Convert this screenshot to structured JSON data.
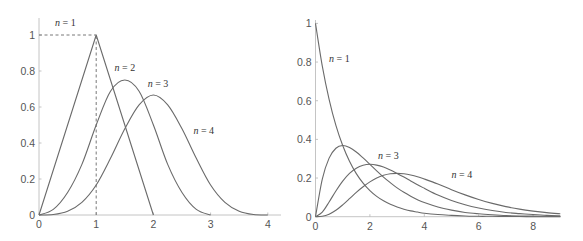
{
  "chart_data": [
    {
      "type": "line",
      "title": "",
      "xlabel": "",
      "ylabel": "",
      "xlim": [
        0,
        4.2
      ],
      "ylim": [
        0,
        1.1
      ],
      "grid": false,
      "x_ticks": [
        "0",
        "1",
        "2",
        "3",
        "4"
      ],
      "y_ticks": [
        "0",
        "0.2",
        "0.4",
        "0.6",
        "0.8",
        "1"
      ],
      "annotations": [
        {
          "type": "dashed-line",
          "from": [
            0,
            1
          ],
          "to": [
            1,
            1
          ]
        },
        {
          "type": "dashed-line",
          "from": [
            1,
            0
          ],
          "to": [
            1,
            1
          ]
        }
      ],
      "series": [
        {
          "name": "n = 1",
          "label_var": "n",
          "label_val": "1",
          "label_pos": [
            0.28,
            1.05
          ],
          "points": []
        },
        {
          "name": "n = 2",
          "label_var": "n",
          "label_val": "2",
          "label_pos": [
            1.32,
            0.8
          ],
          "points": [
            [
              0,
              0
            ],
            [
              1,
              1
            ],
            [
              2,
              0
            ]
          ]
        },
        {
          "name": "n = 3",
          "label_var": "n",
          "label_val": "3",
          "label_pos": [
            1.9,
            0.71
          ],
          "points": [
            [
              0,
              0
            ],
            [
              0.25,
              0.03125
            ],
            [
              0.5,
              0.125
            ],
            [
              0.75,
              0.28125
            ],
            [
              1,
              0.5
            ],
            [
              1.25,
              0.6875
            ],
            [
              1.5,
              0.75
            ],
            [
              1.75,
              0.6875
            ],
            [
              2,
              0.5
            ],
            [
              2.25,
              0.28125
            ],
            [
              2.5,
              0.125
            ],
            [
              2.75,
              0.03125
            ],
            [
              3,
              0
            ]
          ]
        },
        {
          "name": "n = 4",
          "label_var": "n",
          "label_val": "4",
          "label_pos": [
            2.7,
            0.45
          ],
          "points": [
            [
              0,
              0
            ],
            [
              0.25,
              0.0026
            ],
            [
              0.5,
              0.0208
            ],
            [
              0.75,
              0.0703
            ],
            [
              1,
              0.1667
            ],
            [
              1.25,
              0.3151
            ],
            [
              1.5,
              0.4792
            ],
            [
              1.75,
              0.612
            ],
            [
              2,
              0.6667
            ],
            [
              2.25,
              0.612
            ],
            [
              2.5,
              0.4792
            ],
            [
              2.75,
              0.3151
            ],
            [
              3,
              0.1667
            ],
            [
              3.25,
              0.0703
            ],
            [
              3.5,
              0.0208
            ],
            [
              3.75,
              0.0026
            ],
            [
              4,
              0
            ]
          ]
        }
      ]
    },
    {
      "type": "line",
      "title": "",
      "xlabel": "",
      "ylabel": "",
      "xlim": [
        0,
        9
      ],
      "ylim": [
        0,
        1
      ],
      "grid": false,
      "x_ticks": [
        "0",
        "2",
        "4",
        "6",
        "8"
      ],
      "y_ticks": [
        "0",
        "0.2",
        "0.4",
        "0.6",
        "0.8",
        "1"
      ],
      "series": [
        {
          "name": "n = 1",
          "label_var": "n",
          "label_val": "1",
          "label_pos": [
            0.5,
            0.8
          ],
          "points": [
            [
              0,
              1
            ],
            [
              0.25,
              0.779
            ],
            [
              0.5,
              0.607
            ],
            [
              0.75,
              0.472
            ],
            [
              1,
              0.368
            ],
            [
              1.25,
              0.287
            ],
            [
              1.5,
              0.223
            ],
            [
              1.75,
              0.174
            ],
            [
              2,
              0.135
            ],
            [
              2.25,
              0.105
            ],
            [
              2.5,
              0.082
            ],
            [
              2.75,
              0.064
            ],
            [
              3,
              0.05
            ],
            [
              3.25,
              0.039
            ],
            [
              3.5,
              0.03
            ],
            [
              3.75,
              0.024
            ],
            [
              4,
              0.018
            ],
            [
              4.5,
              0.011
            ],
            [
              5,
              0.007
            ],
            [
              5.5,
              0.004
            ],
            [
              6,
              0.002
            ],
            [
              6.5,
              0.002
            ],
            [
              7,
              0.001
            ],
            [
              7.5,
              0.001
            ],
            [
              8,
              0
            ],
            [
              8.5,
              0
            ],
            [
              9,
              0
            ]
          ]
        },
        {
          "name": "n = 2",
          "points": [
            [
              0,
              0
            ],
            [
              0.25,
              0.195
            ],
            [
              0.5,
              0.303
            ],
            [
              0.75,
              0.354
            ],
            [
              1,
              0.368
            ],
            [
              1.25,
              0.358
            ],
            [
              1.5,
              0.335
            ],
            [
              1.75,
              0.304
            ],
            [
              2,
              0.271
            ],
            [
              2.25,
              0.237
            ],
            [
              2.5,
              0.205
            ],
            [
              2.75,
              0.176
            ],
            [
              3,
              0.149
            ],
            [
              3.25,
              0.126
            ],
            [
              3.5,
              0.106
            ],
            [
              3.75,
              0.088
            ],
            [
              4,
              0.073
            ],
            [
              4.5,
              0.05
            ],
            [
              5,
              0.034
            ],
            [
              5.5,
              0.022
            ],
            [
              6,
              0.015
            ],
            [
              6.5,
              0.01
            ],
            [
              7,
              0.006
            ],
            [
              7.5,
              0.004
            ],
            [
              8,
              0.003
            ],
            [
              8.5,
              0.002
            ],
            [
              9,
              0.001
            ]
          ]
        },
        {
          "name": "n = 3",
          "label_var": "n",
          "label_val": "3",
          "label_pos": [
            2.3,
            0.3
          ],
          "points": [
            [
              0,
              0
            ],
            [
              0.25,
              0.024
            ],
            [
              0.5,
              0.076
            ],
            [
              0.75,
              0.133
            ],
            [
              1,
              0.184
            ],
            [
              1.25,
              0.224
            ],
            [
              1.5,
              0.251
            ],
            [
              1.75,
              0.266
            ],
            [
              2,
              0.271
            ],
            [
              2.25,
              0.267
            ],
            [
              2.5,
              0.257
            ],
            [
              2.75,
              0.242
            ],
            [
              3,
              0.224
            ],
            [
              3.25,
              0.205
            ],
            [
              3.5,
              0.185
            ],
            [
              3.75,
              0.165
            ],
            [
              4,
              0.147
            ],
            [
              4.5,
              0.112
            ],
            [
              5,
              0.084
            ],
            [
              5.5,
              0.062
            ],
            [
              6,
              0.045
            ],
            [
              6.5,
              0.032
            ],
            [
              7,
              0.022
            ],
            [
              7.5,
              0.016
            ],
            [
              8,
              0.011
            ],
            [
              8.5,
              0.007
            ],
            [
              9,
              0.005
            ]
          ]
        },
        {
          "name": "n = 4",
          "label_var": "n",
          "label_val": "4",
          "label_pos": [
            5.0,
            0.2
          ],
          "points": [
            [
              0,
              0
            ],
            [
              0.25,
              0.002
            ],
            [
              0.5,
              0.013
            ],
            [
              0.75,
              0.033
            ],
            [
              1,
              0.061
            ],
            [
              1.25,
              0.093
            ],
            [
              1.5,
              0.126
            ],
            [
              1.75,
              0.155
            ],
            [
              2,
              0.18
            ],
            [
              2.25,
              0.2
            ],
            [
              2.5,
              0.214
            ],
            [
              2.75,
              0.222
            ],
            [
              3,
              0.224
            ],
            [
              3.25,
              0.222
            ],
            [
              3.5,
              0.216
            ],
            [
              3.75,
              0.207
            ],
            [
              4,
              0.195
            ],
            [
              4.5,
              0.169
            ],
            [
              5,
              0.14
            ],
            [
              5.5,
              0.113
            ],
            [
              6,
              0.089
            ],
            [
              6.5,
              0.069
            ],
            [
              7,
              0.052
            ],
            [
              7.5,
              0.039
            ],
            [
              8,
              0.029
            ],
            [
              8.5,
              0.021
            ],
            [
              9,
              0.015
            ]
          ]
        }
      ]
    }
  ]
}
